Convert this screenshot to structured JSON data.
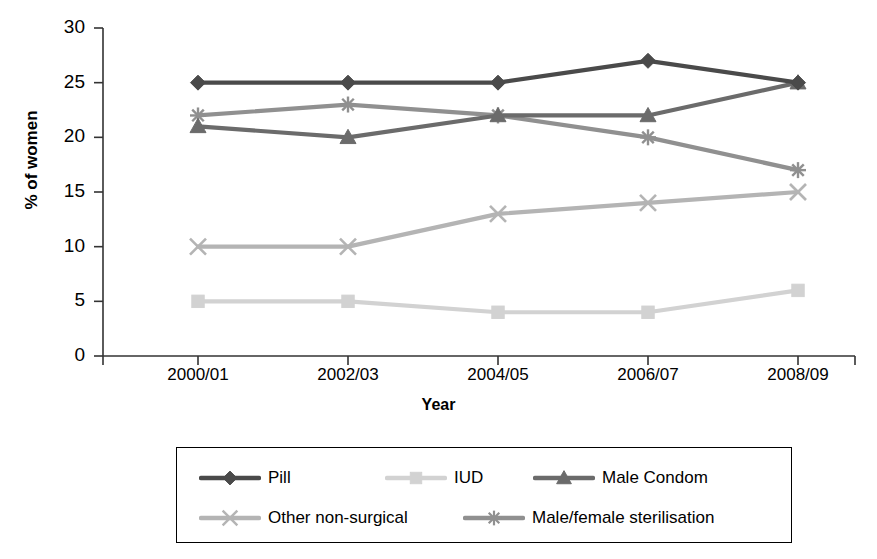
{
  "chart_data": {
    "type": "line",
    "title": "",
    "xlabel": "Year",
    "ylabel": "% of women",
    "categories": [
      "2000/01",
      "2002/03",
      "2004/05",
      "2006/07",
      "2008/09"
    ],
    "ylim": [
      0,
      30
    ],
    "ytick_labels": [
      "30",
      "25",
      "20",
      "15",
      "10",
      "5",
      "0"
    ],
    "ytick_values": [
      30,
      25,
      20,
      15,
      10,
      5,
      0
    ],
    "grid": false,
    "legend_position": "bottom",
    "series": [
      {
        "name": "Pill",
        "values": [
          25,
          25,
          25,
          27,
          25
        ],
        "color": "#4a4a4a",
        "marker": "diamond"
      },
      {
        "name": "IUD",
        "values": [
          5,
          5,
          4,
          4,
          6
        ],
        "color": "#d2d2d2",
        "marker": "square"
      },
      {
        "name": "Male Condom",
        "values": [
          21,
          20,
          22,
          22,
          25
        ],
        "color": "#6b6b6b",
        "marker": "triangle"
      },
      {
        "name": "Other non-surgical",
        "values": [
          10,
          10,
          13,
          14,
          15
        ],
        "color": "#b4b4b4",
        "marker": "cross"
      },
      {
        "name": "Male/female sterilisation",
        "values": [
          22,
          23,
          22,
          20,
          17
        ],
        "color": "#909090",
        "marker": "asterisk"
      }
    ]
  },
  "axis": {
    "y_title": "% of women",
    "x_title": "Year"
  },
  "colors": {
    "axis": "#333333",
    "text": "#000000",
    "background": "#ffffff"
  }
}
